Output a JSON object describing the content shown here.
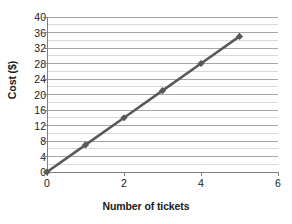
{
  "chart_data": {
    "type": "line",
    "title": "",
    "xlabel": "Number of tickets",
    "ylabel": "Cost ($)",
    "x": [
      0,
      1,
      2,
      3,
      4,
      5
    ],
    "values": [
      0,
      7,
      14,
      21,
      28,
      35
    ],
    "series": [
      {
        "name": "Cost",
        "x": [
          0,
          1,
          2,
          3,
          4,
          5
        ],
        "values": [
          0,
          7,
          14,
          21,
          28,
          35
        ],
        "color": "#595959",
        "marker": "diamond"
      }
    ],
    "xlim": [
      0,
      6
    ],
    "ylim": [
      0,
      40
    ],
    "x_ticks": [
      0,
      2,
      4,
      6
    ],
    "x_tick_labels": [
      "0",
      "2",
      "4",
      "6"
    ],
    "y_ticks": [
      0,
      4,
      8,
      12,
      16,
      20,
      24,
      28,
      32,
      36,
      40
    ],
    "y_tick_labels": [
      "0",
      "4",
      "8",
      "12",
      "16",
      "20",
      "24",
      "28",
      "32",
      "36",
      "40"
    ],
    "y_minor_step": 2,
    "grid": {
      "horizontal_major": true,
      "horizontal_minor": true,
      "vertical": false
    },
    "legend": {
      "visible": false,
      "position": "none"
    },
    "colors": {
      "series": "#595959",
      "gridline_major": "#a6a6a6",
      "gridline_minor": "#d9d9d9",
      "axis": "#808080",
      "text": "#1a1a1a",
      "background": "#ffffff"
    }
  }
}
